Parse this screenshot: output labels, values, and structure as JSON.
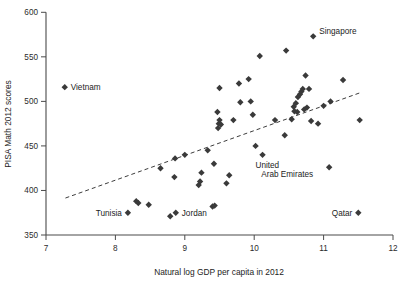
{
  "chart_data": {
    "type": "scatter",
    "title": "",
    "xlabel": "Natural log GDP per capita in 2012",
    "ylabel": "PISA Math 2012 scores",
    "xlim": [
      7,
      12
    ],
    "ylim": [
      350,
      600
    ],
    "xticks": [
      7,
      8,
      9,
      10,
      11,
      12
    ],
    "yticks": [
      350,
      400,
      450,
      500,
      550,
      600
    ],
    "xtick_labels": [
      "7",
      "8",
      "9",
      "10",
      "11",
      "12"
    ],
    "ytick_labels": [
      "350",
      "400",
      "450",
      "500",
      "550",
      "600"
    ],
    "grid": false,
    "legend": "none",
    "marker": "diamond",
    "marker_color": "#3a3a3a",
    "trendline": {
      "style": "dashed",
      "color": "#3d3d3d",
      "x": [
        7.28,
        11.52
      ],
      "y": [
        391.5,
        509.5
      ]
    },
    "points": [
      {
        "x": 7.27,
        "y": 516,
        "label": "Vietnam",
        "label_pos": "right"
      },
      {
        "x": 8.18,
        "y": 375,
        "label": "Tunisia",
        "label_pos": "left"
      },
      {
        "x": 8.3,
        "y": 388,
        "label": "",
        "label_pos": ""
      },
      {
        "x": 8.33,
        "y": 386,
        "label": "",
        "label_pos": ""
      },
      {
        "x": 8.48,
        "y": 384,
        "label": "",
        "label_pos": ""
      },
      {
        "x": 8.65,
        "y": 425,
        "label": "",
        "label_pos": ""
      },
      {
        "x": 8.79,
        "y": 371,
        "label": "",
        "label_pos": ""
      },
      {
        "x": 8.85,
        "y": 415,
        "label": "",
        "label_pos": ""
      },
      {
        "x": 8.86,
        "y": 436,
        "label": "",
        "label_pos": ""
      },
      {
        "x": 8.87,
        "y": 375,
        "label": "Jordan",
        "label_pos": "right"
      },
      {
        "x": 9.0,
        "y": 440,
        "label": "",
        "label_pos": ""
      },
      {
        "x": 9.2,
        "y": 406,
        "label": "",
        "label_pos": ""
      },
      {
        "x": 9.22,
        "y": 410,
        "label": "",
        "label_pos": ""
      },
      {
        "x": 9.24,
        "y": 420,
        "label": "",
        "label_pos": ""
      },
      {
        "x": 9.33,
        "y": 445,
        "label": "",
        "label_pos": ""
      },
      {
        "x": 9.4,
        "y": 382,
        "label": "",
        "label_pos": ""
      },
      {
        "x": 9.43,
        "y": 383,
        "label": "",
        "label_pos": ""
      },
      {
        "x": 9.42,
        "y": 430,
        "label": "",
        "label_pos": ""
      },
      {
        "x": 9.48,
        "y": 470,
        "label": "",
        "label_pos": ""
      },
      {
        "x": 9.49,
        "y": 475,
        "label": "",
        "label_pos": ""
      },
      {
        "x": 9.5,
        "y": 479,
        "label": "",
        "label_pos": ""
      },
      {
        "x": 9.52,
        "y": 474,
        "label": "",
        "label_pos": ""
      },
      {
        "x": 9.47,
        "y": 488,
        "label": "",
        "label_pos": ""
      },
      {
        "x": 9.5,
        "y": 515,
        "label": "",
        "label_pos": ""
      },
      {
        "x": 9.6,
        "y": 408,
        "label": "",
        "label_pos": ""
      },
      {
        "x": 9.64,
        "y": 417,
        "label": "",
        "label_pos": ""
      },
      {
        "x": 9.7,
        "y": 479,
        "label": "",
        "label_pos": ""
      },
      {
        "x": 9.78,
        "y": 520,
        "label": "",
        "label_pos": ""
      },
      {
        "x": 9.8,
        "y": 499,
        "label": "",
        "label_pos": ""
      },
      {
        "x": 9.92,
        "y": 525,
        "label": "",
        "label_pos": ""
      },
      {
        "x": 9.95,
        "y": 500,
        "label": "",
        "label_pos": ""
      },
      {
        "x": 9.98,
        "y": 485,
        "label": "",
        "label_pos": ""
      },
      {
        "x": 10.02,
        "y": 450,
        "label": "",
        "label_pos": ""
      },
      {
        "x": 10.08,
        "y": 551,
        "label": "",
        "label_pos": ""
      },
      {
        "x": 10.12,
        "y": 440,
        "label": "",
        "label_pos": ""
      },
      {
        "x": 10.3,
        "y": 479,
        "label": "",
        "label_pos": ""
      },
      {
        "x": 10.44,
        "y": 462,
        "label": "",
        "label_pos": ""
      },
      {
        "x": 10.46,
        "y": 557,
        "label": "",
        "label_pos": ""
      },
      {
        "x": 10.54,
        "y": 480,
        "label": "",
        "label_pos": ""
      },
      {
        "x": 10.57,
        "y": 494,
        "label": "",
        "label_pos": ""
      },
      {
        "x": 10.58,
        "y": 489,
        "label": "",
        "label_pos": ""
      },
      {
        "x": 10.6,
        "y": 498,
        "label": "",
        "label_pos": ""
      },
      {
        "x": 10.62,
        "y": 488,
        "label": "",
        "label_pos": ""
      },
      {
        "x": 10.63,
        "y": 505,
        "label": "",
        "label_pos": ""
      },
      {
        "x": 10.66,
        "y": 508,
        "label": "",
        "label_pos": ""
      },
      {
        "x": 10.68,
        "y": 511,
        "label": "",
        "label_pos": ""
      },
      {
        "x": 10.7,
        "y": 514,
        "label": "",
        "label_pos": ""
      },
      {
        "x": 10.72,
        "y": 491,
        "label": "",
        "label_pos": ""
      },
      {
        "x": 10.74,
        "y": 529,
        "label": "",
        "label_pos": ""
      },
      {
        "x": 10.76,
        "y": 493,
        "label": "",
        "label_pos": ""
      },
      {
        "x": 10.79,
        "y": 514,
        "label": "",
        "label_pos": ""
      },
      {
        "x": 10.82,
        "y": 478,
        "label": "",
        "label_pos": ""
      },
      {
        "x": 10.85,
        "y": 573,
        "label": "Singapore",
        "label_pos": "right"
      },
      {
        "x": 10.92,
        "y": 475,
        "label": "",
        "label_pos": ""
      },
      {
        "x": 11.0,
        "y": 495,
        "label": "",
        "label_pos": ""
      },
      {
        "x": 11.08,
        "y": 426,
        "label": "United Arab Emirates",
        "label_pos": "left-two-line"
      },
      {
        "x": 11.1,
        "y": 500,
        "label": "",
        "label_pos": ""
      },
      {
        "x": 11.28,
        "y": 524,
        "label": "",
        "label_pos": ""
      },
      {
        "x": 11.5,
        "y": 375,
        "label": "Qatar",
        "label_pos": "left"
      },
      {
        "x": 11.52,
        "y": 479,
        "label": "",
        "label_pos": ""
      }
    ],
    "annotations": [
      {
        "text": "Vietnam",
        "x": 7.27,
        "y": 516
      },
      {
        "text": "Singapore",
        "x": 10.85,
        "y": 573
      },
      {
        "text": "Tunisia",
        "x": 8.18,
        "y": 375
      },
      {
        "text": "Jordan",
        "x": 8.87,
        "y": 375
      },
      {
        "text": "United",
        "x": 11.08,
        "y": 426
      },
      {
        "text": "Arab Emirates",
        "x": 11.08,
        "y": 426
      },
      {
        "text": "Qatar",
        "x": 11.5,
        "y": 375
      }
    ]
  },
  "labels": {
    "vietnam": "Vietnam",
    "singapore": "Singapore",
    "tunisia": "Tunisia",
    "jordan": "Jordan",
    "uae_line1": "United",
    "uae_line2": "Arab Emirates",
    "qatar": "Qatar"
  }
}
